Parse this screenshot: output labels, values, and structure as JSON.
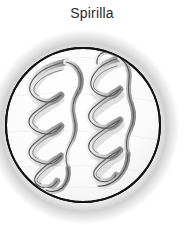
{
  "figure": {
    "title": "Spirilla",
    "caption_position": "top-center",
    "background_color": "#ffffff",
    "title_color": "#2a2a2a"
  },
  "field": {
    "name": "microscope-field",
    "shape": "circle",
    "center_x": 83,
    "center_y": 125,
    "radius": 78,
    "fill_color": "#fbfbfb",
    "outline_color": "#1a1a1a",
    "outline_width": 2,
    "shadow_color": "#9a9a9a"
  },
  "organisms": [
    {
      "id": "spirillum-left",
      "name": "spirillum-left",
      "shape": "helix",
      "turns": 4,
      "center_x": 52,
      "top_y": 62,
      "bottom_y": 188,
      "amplitude": 21,
      "stroke_color": "#4a4a4a",
      "fill_color": "#c9c9c9"
    },
    {
      "id": "spirillum-right",
      "name": "spirillum-right",
      "shape": "helix",
      "turns": 4,
      "center_x": 112,
      "top_y": 58,
      "bottom_y": 192,
      "amplitude": 21,
      "stroke_color": "#4a4a4a",
      "fill_color": "#c9c9c9"
    }
  ]
}
